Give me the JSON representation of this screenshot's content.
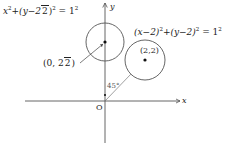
{
  "diagram": {
    "title": "",
    "axes": {
      "x_label": "x",
      "y_label": "y",
      "origin_label": "O"
    },
    "circle_1": {
      "equation_lhs_a": "x",
      "equation_lhs_b": "+(y−2",
      "equation_sqrt_radicand": "2",
      "equation_lhs_c": ")",
      "equation_rhs": "= 1",
      "exp": "2",
      "center_label_open": "(0, 2",
      "center_sqrt_radicand": "2",
      "center_label_close": ")"
    },
    "circle_2": {
      "equation_a": "(x−2)",
      "equation_b": "+(y−2)",
      "equation_rhs": "= 1",
      "exp": "2",
      "center_label": "(2,2)"
    },
    "angle_label": "45°",
    "colors": {
      "stroke": "#444444",
      "axis": "#555555",
      "text": "#222222"
    }
  }
}
